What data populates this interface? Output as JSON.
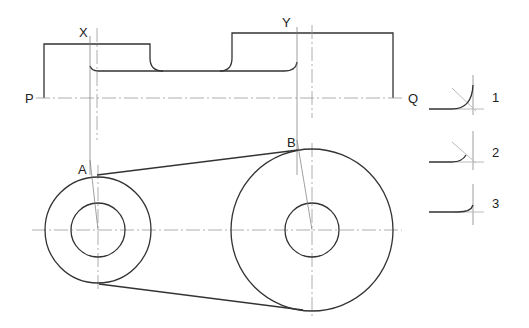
{
  "drawing": {
    "title": "",
    "labels": {
      "X": "X",
      "Y": "Y",
      "P": "P",
      "Q": "Q",
      "A": "A",
      "B": "B"
    },
    "fillet_options": [
      {
        "label": "1"
      },
      {
        "label": "2"
      },
      {
        "label": "3"
      }
    ],
    "colors": {
      "line": "#333333",
      "thin": "#777777",
      "centerline": "#999999",
      "construction": "#bbbbbb"
    }
  }
}
